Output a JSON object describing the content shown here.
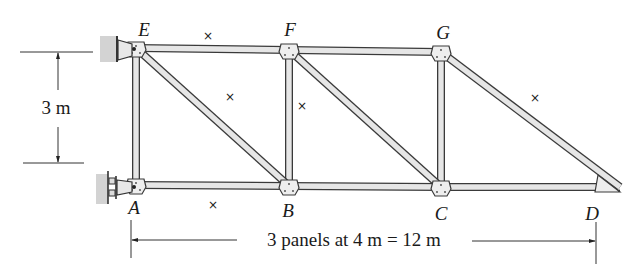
{
  "figure": {
    "joints": [
      {
        "id": "E",
        "label": "E",
        "x": 136,
        "y": 48,
        "lx": 144,
        "ly": 36
      },
      {
        "id": "F",
        "label": "F",
        "x": 289,
        "y": 50,
        "lx": 290,
        "ly": 36
      },
      {
        "id": "G",
        "label": "G",
        "x": 441,
        "y": 52,
        "lx": 443,
        "ly": 39
      },
      {
        "id": "A",
        "label": "A",
        "x": 136,
        "y": 185,
        "lx": 134,
        "ly": 214
      },
      {
        "id": "B",
        "label": "B",
        "x": 289,
        "y": 186,
        "lx": 288,
        "ly": 217
      },
      {
        "id": "C",
        "label": "C",
        "x": 441,
        "y": 187,
        "lx": 441,
        "ly": 220
      },
      {
        "id": "D",
        "label": "D",
        "x": 620,
        "y": 187,
        "lx": 592,
        "ly": 220
      }
    ],
    "members": [
      [
        "E",
        "F"
      ],
      [
        "F",
        "G"
      ],
      [
        "A",
        "B"
      ],
      [
        "B",
        "C"
      ],
      [
        "C",
        "D"
      ],
      [
        "E",
        "A"
      ],
      [
        "F",
        "B"
      ],
      [
        "G",
        "C"
      ],
      [
        "E",
        "B"
      ],
      [
        "F",
        "C"
      ],
      [
        "G",
        "D"
      ]
    ],
    "zero_force_marks": [
      {
        "symbol": "×",
        "x": 208,
        "y": 40
      },
      {
        "symbol": "×",
        "x": 230,
        "y": 101
      },
      {
        "symbol": "×",
        "x": 302,
        "y": 110
      },
      {
        "symbol": "×",
        "x": 535,
        "y": 102
      },
      {
        "symbol": "×",
        "x": 213,
        "y": 209
      }
    ],
    "supports": [
      {
        "joint": "E",
        "type": "pin"
      },
      {
        "joint": "A",
        "type": "roller"
      }
    ],
    "dimensions": {
      "height_label": "3 m",
      "span_label": "3 panels at 4 m = 12 m"
    },
    "colors": {
      "stroke": "#3a3a3a",
      "member_fill": "#e6e6e6",
      "wall": "#bdbdbd"
    }
  }
}
